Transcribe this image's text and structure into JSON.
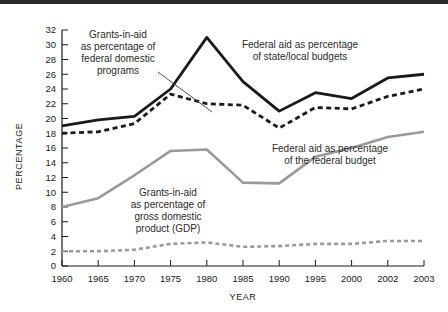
{
  "chart_data": {
    "type": "line",
    "title": "",
    "xlabel": "YEAR",
    "ylabel": "PERCENTAGE",
    "categories": [
      "1960",
      "1965",
      "1970",
      "1975",
      "1980",
      "1985",
      "1990",
      "1995",
      "2000",
      "2002",
      "2003"
    ],
    "ylim": [
      0,
      32
    ],
    "ytick_step": 2,
    "yticks": [
      "0",
      "2",
      "4",
      "6",
      "8",
      "10",
      "12",
      "14",
      "16",
      "18",
      "20",
      "22",
      "24",
      "26",
      "28",
      "30",
      "32"
    ],
    "grid": false,
    "legend": "annotations",
    "series": [
      {
        "name": "Federal aid as percentage of state/local budgets",
        "style": "solid",
        "color": "#1a1a1a",
        "values": [
          19.0,
          19.8,
          20.3,
          24.0,
          31.0,
          25.0,
          21.0,
          23.5,
          22.7,
          25.5,
          26.0
        ]
      },
      {
        "name": "Grants-in-aid as percentage of federal domestic programs",
        "style": "dashed",
        "color": "#1a1a1a",
        "values": [
          18.0,
          18.2,
          19.3,
          23.3,
          22.0,
          21.8,
          18.7,
          21.5,
          21.3,
          23.0,
          24.0
        ]
      },
      {
        "name": "Federal aid as percentage of the federal budget",
        "style": "solid",
        "color": "#9a9a9a",
        "values": [
          8.0,
          9.2,
          12.3,
          15.6,
          15.8,
          11.3,
          11.2,
          14.8,
          16.0,
          17.5,
          18.2
        ]
      },
      {
        "name": "Grants-in-aid as percentage of gross domestic product (GDP)",
        "style": "dashed",
        "color": "#9a9a9a",
        "values": [
          2.0,
          2.0,
          2.2,
          3.0,
          3.2,
          2.6,
          2.7,
          3.0,
          3.0,
          3.4,
          3.4
        ]
      }
    ],
    "annotations": [
      {
        "id": "grants-federal-domestic",
        "lines": [
          "Grants-in-aid",
          "as percentage of",
          "federal domestic",
          "programs"
        ],
        "leader": true
      },
      {
        "id": "federal-aid-state-local",
        "lines": [
          "Federal aid as percentage",
          "of state/local budgets"
        ],
        "leader": false
      },
      {
        "id": "grants-gdp",
        "lines": [
          "Grants-in-aid",
          "as percentage of",
          "gross domestic",
          "product (GDP)"
        ],
        "leader": false
      },
      {
        "id": "federal-aid-federal-budget",
        "lines": [
          "Federal aid as percentage",
          "of the federal budget"
        ],
        "leader": false
      }
    ]
  }
}
